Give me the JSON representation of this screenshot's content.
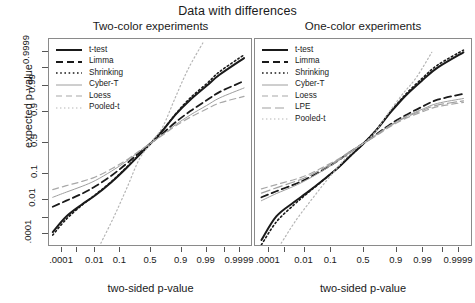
{
  "chart_data": {
    "type": "line",
    "title": "Data with differences",
    "xlabel": "two-sided p-value",
    "ylabel": "expected p-value",
    "grid": false,
    "legend_position": "top-left inside panel",
    "axis_scale": "probit (normal quantile) on both axes",
    "x_ticks_labeled": [
      ".0001",
      "0.01",
      "0.1",
      "0.5",
      "0.9",
      "0.99",
      "0.9999"
    ],
    "x_tick_values": [
      0.0001,
      0.01,
      0.1,
      0.5,
      0.9,
      0.99,
      0.9999
    ],
    "y_ticks_labeled": [
      ".0001",
      "0.01",
      "0.1",
      "0.5",
      "0.9",
      "0.99",
      "0.9999"
    ],
    "y_tick_values": [
      0.0001,
      0.01,
      0.1,
      0.5,
      0.9,
      0.99,
      0.9999
    ],
    "xlim": [
      1e-05,
      0.99999
    ],
    "ylim": [
      1e-05,
      0.99999
    ],
    "panels": [
      {
        "title": "Two-color experiments",
        "series": [
          {
            "name": "t-test",
            "style": "solid-thick",
            "color": "#1a1a1a",
            "x": [
              2e-05,
              0.0002,
              0.002,
              0.01,
              0.05,
              0.15,
              0.3,
              0.5,
              0.7,
              0.85,
              0.95,
              0.99,
              0.998,
              0.99995
            ],
            "y": [
              0.00013,
              0.0013,
              0.006,
              0.016,
              0.055,
              0.15,
              0.3,
              0.5,
              0.71,
              0.88,
              0.962,
              0.9905,
              0.9975,
              0.99975
            ]
          },
          {
            "name": "Limma",
            "style": "dashed",
            "color": "#1a1a1a",
            "x": [
              2e-05,
              0.0002,
              0.002,
              0.01,
              0.05,
              0.15,
              0.3,
              0.5,
              0.7,
              0.85,
              0.95,
              0.99,
              0.998,
              0.99995
            ],
            "y": [
              0.0045,
              0.009,
              0.019,
              0.038,
              0.092,
              0.195,
              0.335,
              0.5,
              0.665,
              0.805,
              0.905,
              0.96,
              0.982,
              0.9945
            ]
          },
          {
            "name": "Shrinking",
            "style": "dotted",
            "color": "#1a1a1a",
            "x": [
              2e-05,
              0.0002,
              0.002,
              0.01,
              0.05,
              0.15,
              0.3,
              0.5,
              0.7,
              0.85,
              0.95,
              0.99,
              0.998,
              0.99995
            ],
            "y": [
              8e-05,
              0.0009,
              0.0055,
              0.017,
              0.058,
              0.155,
              0.305,
              0.5,
              0.715,
              0.885,
              0.968,
              0.9925,
              0.9983,
              0.99985
            ]
          },
          {
            "name": "Cyber-T",
            "style": "solid-thin",
            "color": "#9e9e9e",
            "x": [
              2e-05,
              0.0002,
              0.002,
              0.01,
              0.05,
              0.15,
              0.3,
              0.5,
              0.7,
              0.85,
              0.95,
              0.99,
              0.998,
              0.99995
            ],
            "y": [
              0.013,
              0.022,
              0.038,
              0.062,
              0.125,
              0.225,
              0.355,
              0.5,
              0.645,
              0.775,
              0.875,
              0.938,
              0.968,
              0.988
            ]
          },
          {
            "name": "Loess",
            "style": "dashed-gray",
            "color": "#a8a8a8",
            "x": [
              2e-05,
              0.0002,
              0.002,
              0.01,
              0.05,
              0.15,
              0.3,
              0.5,
              0.7,
              0.85,
              0.95,
              0.99,
              0.998,
              0.99995
            ],
            "y": [
              0.028,
              0.04,
              0.058,
              0.082,
              0.145,
              0.24,
              0.365,
              0.5,
              0.635,
              0.76,
              0.855,
              0.918,
              0.95,
              0.972
            ]
          },
          {
            "name": "Pooled-t",
            "style": "dotted-gray",
            "color": "#b5b5b5",
            "note": "near-diagonal steep reference curve crossing 0.5,0.5",
            "x": [
              0.018,
              0.06,
              0.16,
              0.31,
              0.5,
              0.69,
              0.84,
              0.94,
              0.985
            ],
            "y": [
              2e-05,
              0.0012,
              0.035,
              0.25,
              0.5,
              0.75,
              0.965,
              0.9988,
              0.99998
            ]
          }
        ]
      },
      {
        "title": "One-color experiments",
        "series": [
          {
            "name": "t-test",
            "style": "solid-thick",
            "color": "#1a1a1a",
            "x": [
              3e-05,
              0.0003,
              0.003,
              0.012,
              0.05,
              0.15,
              0.3,
              0.5,
              0.7,
              0.85,
              0.95,
              0.99,
              0.998,
              0.99995
            ],
            "y": [
              3.5e-05,
              0.0013,
              0.0075,
              0.02,
              0.06,
              0.15,
              0.3,
              0.5,
              0.72,
              0.895,
              0.975,
              0.9955,
              0.999,
              0.9999
            ]
          },
          {
            "name": "Limma",
            "style": "dashed",
            "color": "#1a1a1a",
            "x": [
              3e-05,
              0.0003,
              0.003,
              0.012,
              0.05,
              0.15,
              0.3,
              0.5,
              0.7,
              0.85,
              0.95,
              0.99,
              0.998,
              0.99995
            ],
            "y": [
              0.013,
              0.024,
              0.044,
              0.07,
              0.13,
              0.23,
              0.36,
              0.5,
              0.65,
              0.78,
              0.875,
              0.935,
              0.962,
              0.978
            ]
          },
          {
            "name": "Shrinking",
            "style": "dotted",
            "color": "#1a1a1a",
            "x": [
              3e-05,
              0.0003,
              0.003,
              0.012,
              0.05,
              0.15,
              0.3,
              0.5,
              0.7,
              0.85,
              0.95,
              0.99,
              0.998,
              0.99995
            ],
            "y": [
              1.5e-05,
              0.0006,
              0.0055,
              0.018,
              0.058,
              0.152,
              0.302,
              0.5,
              0.725,
              0.9,
              0.978,
              0.9965,
              0.9993,
              0.99993
            ]
          },
          {
            "name": "Cyber-T",
            "style": "solid-thin",
            "color": "#9e9e9e",
            "x": [
              3e-05,
              0.0003,
              0.003,
              0.012,
              0.05,
              0.15,
              0.3,
              0.5,
              0.7,
              0.85,
              0.95,
              0.99,
              0.998,
              0.99995
            ],
            "y": [
              0.009,
              0.019,
              0.038,
              0.064,
              0.125,
              0.225,
              0.355,
              0.5,
              0.645,
              0.77,
              0.862,
              0.92,
              0.948,
              0.966
            ]
          },
          {
            "name": "Loess",
            "style": "dashed-gray",
            "color": "#a8a8a8",
            "x": [
              3e-05,
              0.0003,
              0.003,
              0.012,
              0.05,
              0.15,
              0.3,
              0.5,
              0.7,
              0.85,
              0.95,
              0.99,
              0.998,
              0.99995
            ],
            "y": [
              0.03,
              0.044,
              0.066,
              0.092,
              0.155,
              0.248,
              0.37,
              0.5,
              0.63,
              0.752,
              0.845,
              0.903,
              0.932,
              0.952
            ]
          },
          {
            "name": "LPE",
            "style": "longdash-gray",
            "color": "#a0a0a0",
            "x": [
              3e-05,
              0.0003,
              0.003,
              0.012,
              0.05,
              0.15,
              0.3,
              0.5,
              0.7,
              0.85,
              0.95,
              0.99,
              0.998,
              0.99995
            ],
            "y": [
              0.02,
              0.033,
              0.055,
              0.08,
              0.142,
              0.238,
              0.362,
              0.5,
              0.638,
              0.762,
              0.855,
              0.912,
              0.94,
              0.958
            ]
          },
          {
            "name": "Pooled-t",
            "style": "dotted-gray",
            "color": "#b5b5b5",
            "x": [
              0.0006,
              0.004,
              0.02,
              0.07,
              0.18,
              0.34,
              0.5,
              0.66,
              0.82,
              0.93,
              0.98,
              0.996
            ],
            "y": [
              2e-05,
              0.0008,
              0.01,
              0.06,
              0.195,
              0.39,
              0.5,
              0.66,
              0.88,
              0.975,
              0.9965,
              0.9999
            ]
          }
        ]
      }
    ]
  },
  "title": {
    "text": "Data with differences"
  },
  "panel_titles": {
    "left": "Two-color experiments",
    "right": "One-color experiments"
  },
  "axes": {
    "y_label": "expected p-value",
    "x_label": "two-sided p-value",
    "y_tick_labels": [
      ".0001",
      "0.01",
      "0.1",
      "0.5",
      "0.9",
      "0.99",
      "0.9999"
    ],
    "x_tick_labels": [
      ".0001",
      "0.01",
      "0.1",
      "0.5",
      "0.9",
      "0.99",
      "0.9999"
    ]
  },
  "legend_left": {
    "items": [
      {
        "label": "t-test",
        "style": "solid-thick",
        "color": "#1a1a1a"
      },
      {
        "label": "Limma",
        "style": "dashed",
        "color": "#1a1a1a"
      },
      {
        "label": "Shrinking",
        "style": "dotted",
        "color": "#1a1a1a"
      },
      {
        "label": "Cyber-T",
        "style": "solid-thin",
        "color": "#9e9e9e"
      },
      {
        "label": "Loess",
        "style": "dashed-gray",
        "color": "#a8a8a8"
      },
      {
        "label": "Pooled-t",
        "style": "dotted-gray",
        "color": "#b5b5b5"
      }
    ]
  },
  "legend_right": {
    "items": [
      {
        "label": "t-test",
        "style": "solid-thick",
        "color": "#1a1a1a"
      },
      {
        "label": "Limma",
        "style": "dashed",
        "color": "#1a1a1a"
      },
      {
        "label": "Shrinking",
        "style": "dotted",
        "color": "#1a1a1a"
      },
      {
        "label": "Cyber-T",
        "style": "solid-thin",
        "color": "#9e9e9e"
      },
      {
        "label": "Loess",
        "style": "dashed-gray",
        "color": "#a8a8a8"
      },
      {
        "label": "LPE",
        "style": "longdash-gray",
        "color": "#a0a0a0"
      },
      {
        "label": "Pooled-t",
        "style": "dotted-gray",
        "color": "#b5b5b5"
      }
    ]
  }
}
